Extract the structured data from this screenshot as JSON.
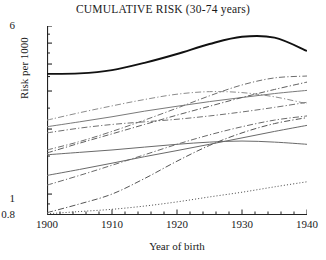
{
  "chart_data": {
    "type": "line",
    "title": "CUMULATIVE RISK (30-74 years)",
    "xlabel": "Year of birth",
    "ylabel": "Risk per 1000",
    "xlim": [
      1900,
      1940
    ],
    "ylim": [
      0.8,
      6
    ],
    "yscale": "log",
    "grid": false,
    "legend": "none",
    "xticks": [
      1900,
      1910,
      1920,
      1930,
      1940
    ],
    "xtick_labels": [
      "1900",
      "1910",
      "1920",
      "1930",
      "1940"
    ],
    "xminor_step": 2,
    "yticks": [
      0.8,
      1,
      2,
      3,
      4,
      5,
      6
    ],
    "ytick_labels": [
      "0.8",
      "1",
      "",
      "",
      "",
      "",
      "6"
    ],
    "x": [
      1900,
      1905,
      1910,
      1915,
      1920,
      1925,
      1930,
      1935,
      1940
    ],
    "series": [
      {
        "name": "series-1",
        "style": "solid",
        "width": 1.9,
        "color": "#111111",
        "values": [
          3.6,
          3.62,
          3.75,
          4.05,
          4.45,
          4.95,
          5.35,
          5.3,
          4.6
        ]
      },
      {
        "name": "series-2",
        "style": "dashdot",
        "width": 1.0,
        "color": "#6e6e6e",
        "values": [
          1.6,
          1.75,
          1.95,
          2.2,
          2.5,
          2.85,
          3.2,
          3.45,
          3.52
        ]
      },
      {
        "name": "series-3",
        "style": "dashdot",
        "width": 1.0,
        "color": "#8c8c8c",
        "values": [
          2.2,
          2.38,
          2.56,
          2.74,
          2.9,
          2.98,
          2.95,
          2.82,
          2.62
        ]
      },
      {
        "name": "series-4",
        "style": "solid",
        "width": 1.0,
        "color": "#7a7a7a",
        "values": [
          2.05,
          2.16,
          2.28,
          2.42,
          2.55,
          2.68,
          2.8,
          2.92,
          3.02
        ]
      },
      {
        "name": "series-5",
        "style": "dashdot",
        "width": 1.0,
        "color": "#707070",
        "values": [
          1.92,
          2.02,
          2.1,
          2.16,
          2.22,
          2.3,
          2.4,
          2.52,
          2.66
        ]
      },
      {
        "name": "series-6",
        "style": "dashdot",
        "width": 1.0,
        "color": "#5f5f5f",
        "values": [
          1.55,
          1.72,
          1.9,
          2.1,
          2.32,
          2.55,
          2.8,
          3.05,
          3.3
        ]
      },
      {
        "name": "series-7",
        "style": "solid",
        "width": 1.0,
        "color": "#6a6a6a",
        "values": [
          1.52,
          1.56,
          1.6,
          1.65,
          1.7,
          1.74,
          1.76,
          1.74,
          1.7
        ]
      },
      {
        "name": "series-8",
        "style": "solid",
        "width": 1.0,
        "color": "#6a6a6a",
        "values": [
          1.22,
          1.3,
          1.39,
          1.49,
          1.59,
          1.7,
          1.82,
          1.95,
          2.08
        ]
      },
      {
        "name": "series-9",
        "style": "dashdot",
        "width": 1.0,
        "color": "#6a6a6a",
        "values": [
          1.1,
          1.22,
          1.36,
          1.52,
          1.7,
          1.88,
          2.05,
          2.2,
          2.3
        ]
      },
      {
        "name": "series-10",
        "style": "dashdot",
        "width": 1.0,
        "color": "#555555",
        "values": [
          0.82,
          0.9,
          1.0,
          1.18,
          1.42,
          1.68,
          1.92,
          2.12,
          2.26
        ]
      },
      {
        "name": "series-11",
        "style": "dotted",
        "width": 1.0,
        "color": "#555555",
        "values": [
          0.81,
          0.83,
          0.85,
          0.88,
          0.92,
          0.97,
          1.02,
          1.08,
          1.14
        ]
      }
    ]
  }
}
